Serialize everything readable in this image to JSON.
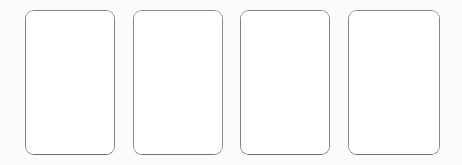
{
  "canvas": {
    "width": 462,
    "height": 165,
    "background_color": "#fbfbfb"
  },
  "card_row": {
    "name": "card-placeholder-row",
    "count": 4,
    "card_fill_color": "#ffffff",
    "card_border_color": "#858585",
    "card_corner_radius": "9px",
    "cards": [
      {
        "label": "",
        "x": 25,
        "y": 10,
        "width": 90,
        "height": 145
      },
      {
        "label": "",
        "x": 133,
        "y": 10,
        "width": 90,
        "height": 145
      },
      {
        "label": "",
        "x": 240,
        "y": 10,
        "width": 90,
        "height": 145
      },
      {
        "label": "",
        "x": 348,
        "y": 10,
        "width": 92,
        "height": 145
      }
    ]
  }
}
